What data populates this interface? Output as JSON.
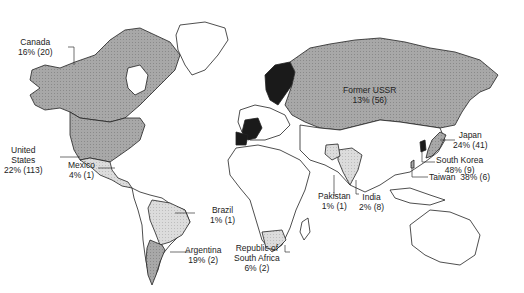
{
  "map": {
    "type": "choropleth world map",
    "colors": {
      "background": "#ffffff",
      "land_unshaded": "#ffffff",
      "shade_light": "#d8d8d8",
      "shade_medium": "#a6a6a6",
      "shade_dark": "#8c8c8c",
      "shade_black": "#1a1a1a",
      "outline": "#222222"
    },
    "labels": [
      {
        "id": "canada",
        "name": "Canada",
        "value": "16% (20)"
      },
      {
        "id": "united-states",
        "name_line1": "United",
        "name_line2": "States",
        "value": "22% (113)"
      },
      {
        "id": "mexico",
        "name": "Mexico",
        "value": "4% (1)"
      },
      {
        "id": "brazil",
        "name": "Brazil",
        "value": "1% (1)"
      },
      {
        "id": "argentina",
        "name": "Argentina",
        "value": "19% (2)"
      },
      {
        "id": "south-africa",
        "name_line1": "Republic of",
        "name_line2": "South Africa",
        "value": "6% (2)"
      },
      {
        "id": "former-ussr",
        "name": "Former USSR",
        "value": "13% (56)"
      },
      {
        "id": "pakistan",
        "name": "Pakistan",
        "value": "1% (1)"
      },
      {
        "id": "india",
        "name": "India",
        "value": "2% (8)"
      },
      {
        "id": "japan",
        "name": "Japan",
        "value": "24% (41)"
      },
      {
        "id": "south-korea",
        "name": "South Korea",
        "value": "48% (9)"
      },
      {
        "id": "taiwan",
        "name": "Taiwan",
        "value": "38% (6)"
      }
    ]
  }
}
